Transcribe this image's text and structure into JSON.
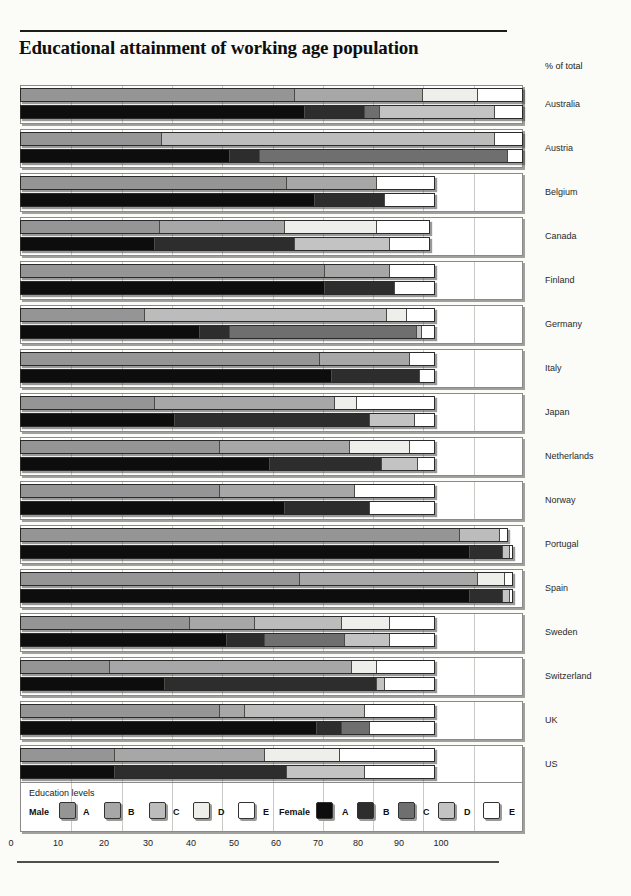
{
  "page": {
    "title": "Educational attainment of working age population",
    "unit_note": "% of total"
  },
  "legend": {
    "title": "Education levels",
    "male_label": "Male",
    "female_label": "Female",
    "levels": [
      "A",
      "B",
      "C",
      "D",
      "E"
    ]
  },
  "colors": {
    "male": {
      "A": "#959595",
      "B": "#a7a7a7",
      "C": "#bcbcbc",
      "D": "#eeeeea",
      "E": "#ffffff"
    },
    "female": {
      "A": "#0d0d0d",
      "B": "#2d2d2d",
      "C": "#6f6f6f",
      "D": "#c3c3c3",
      "E": "#ffffff"
    },
    "panel_border": "#8a8a8a",
    "gridline": "#c9c9c5",
    "bar_border": "#2b2b2b"
  },
  "x_axis": {
    "ticks": [
      "0",
      "10",
      "20",
      "30",
      "40",
      "50",
      "60",
      "70",
      "80",
      "90",
      "100"
    ]
  },
  "chart_data": {
    "type": "bar",
    "orientation": "horizontal",
    "stacked": true,
    "title": "Educational attainment of working age population",
    "xlabel": "% of total",
    "xlim": [
      0,
      100
    ],
    "grid": true,
    "legend_position": "bottom",
    "levels": [
      "A",
      "B",
      "C",
      "D",
      "E"
    ],
    "series_groups": [
      "Male",
      "Female"
    ],
    "countries": [
      {
        "name": "Australia",
        "male": {
          "A": 54.5,
          "B": 25.5,
          "C": 0,
          "D": 11,
          "E": 9
        },
        "female": {
          "A": 56.5,
          "B": 12,
          "C": 3,
          "D": 23,
          "E": 5.5
        }
      },
      {
        "name": "Austria",
        "male": {
          "A": 28,
          "B": 0,
          "C": 66.5,
          "D": 0,
          "E": 5.5
        },
        "female": {
          "A": 41.5,
          "B": 6,
          "C": 49.5,
          "D": 0,
          "E": 3
        }
      },
      {
        "name": "Belgium",
        "male": {
          "A": 53,
          "B": 18,
          "C": 0,
          "D": 0,
          "E": 11.5
        },
        "female": {
          "A": 58.5,
          "B": 14,
          "C": 0,
          "D": 0,
          "E": 10
        }
      },
      {
        "name": "Canada",
        "male": {
          "A": 27.5,
          "B": 25,
          "C": 0,
          "D": 18.5,
          "E": 10.5
        },
        "female": {
          "A": 26.5,
          "B": 28,
          "C": 0,
          "D": 19,
          "E": 8
        }
      },
      {
        "name": "Finland",
        "male": {
          "A": 60.5,
          "B": 13,
          "C": 0,
          "D": 0,
          "E": 9
        },
        "female": {
          "A": 60.5,
          "B": 14,
          "C": 0,
          "D": 0,
          "E": 8
        }
      },
      {
        "name": "Germany",
        "male": {
          "A": 24.5,
          "B": 0,
          "C": 48.5,
          "D": 4,
          "E": 5.5
        },
        "female": {
          "A": 35.5,
          "B": 6,
          "C": 37.5,
          "D": 1,
          "E": 2.5
        }
      },
      {
        "name": "Italy",
        "male": {
          "A": 59.5,
          "B": 18,
          "C": 0,
          "D": 0,
          "E": 5
        },
        "female": {
          "A": 62,
          "B": 17.5,
          "C": 0,
          "D": 0,
          "E": 3
        }
      },
      {
        "name": "Japan",
        "male": {
          "A": 26.5,
          "B": 36,
          "C": 0,
          "D": 4.5,
          "E": 15.5
        },
        "female": {
          "A": 30.5,
          "B": 39,
          "C": 0,
          "D": 9,
          "E": 4
        }
      },
      {
        "name": "Netherlands",
        "male": {
          "A": 39.5,
          "B": 26,
          "C": 0,
          "D": 12,
          "E": 5
        },
        "female": {
          "A": 49.5,
          "B": 22.5,
          "C": 0,
          "D": 7,
          "E": 3.5
        }
      },
      {
        "name": "Norway",
        "male": {
          "A": 39.5,
          "B": 27,
          "C": 0,
          "D": 0,
          "E": 16
        },
        "female": {
          "A": 52.5,
          "B": 17,
          "C": 0,
          "D": 0,
          "E": 13
        }
      },
      {
        "name": "Portugal",
        "male": {
          "A": 87.5,
          "B": 0,
          "C": 8,
          "D": 0,
          "E": 1.5
        },
        "female": {
          "A": 89.5,
          "B": 6.5,
          "C": 0,
          "D": 1.5,
          "E": 0.5
        }
      },
      {
        "name": "Spain",
        "male": {
          "A": 55.5,
          "B": 35.5,
          "C": 0,
          "D": 5.5,
          "E": 1.5
        },
        "female": {
          "A": 89.5,
          "B": 6.5,
          "C": 0,
          "D": 1.5,
          "E": 0.5
        }
      },
      {
        "name": "Sweden",
        "male": {
          "A": 33.5,
          "B": 13,
          "C": 17.5,
          "D": 9.5,
          "E": 9
        },
        "female": {
          "A": 41,
          "B": 7.5,
          "C": 16,
          "D": 9,
          "E": 9
        }
      },
      {
        "name": "Switzerland",
        "male": {
          "A": 17.5,
          "B": 48.5,
          "C": 0,
          "D": 5,
          "E": 11.5
        },
        "female": {
          "A": 28.5,
          "B": 42.5,
          "C": 0,
          "D": 1.5,
          "E": 10
        }
      },
      {
        "name": "UK",
        "male": {
          "A": 39.5,
          "B": 5,
          "C": 24,
          "D": 0,
          "E": 14
        },
        "female": {
          "A": 59,
          "B": 5,
          "C": 5.5,
          "D": 0,
          "E": 13
        }
      },
      {
        "name": "US",
        "male": {
          "A": 18.5,
          "B": 30,
          "C": 0,
          "D": 15,
          "E": 19
        },
        "female": {
          "A": 18.5,
          "B": 34.5,
          "C": 0,
          "D": 15.5,
          "E": 14
        }
      }
    ]
  }
}
